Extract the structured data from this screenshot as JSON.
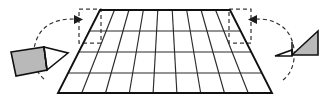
{
  "figure": {
    "canvas": {
      "width": 329,
      "height": 107,
      "background": "#ffffff"
    }
  },
  "colors": {
    "line": "#1b1b1b",
    "grid": "#2a2a2a",
    "dashed": "#3a3a3a",
    "shaded_fill": "#b9b9b9",
    "unshaded_fill": "#ffffff",
    "background": "#ffffff"
  },
  "shape": {
    "name": "trapezoid",
    "vertices": {
      "top_left": [
        100,
        10
      ],
      "top_right": [
        230,
        10
      ],
      "bottom_right": [
        272,
        93
      ],
      "bottom_left": [
        58,
        93
      ]
    },
    "grid": {
      "rows": 4,
      "columns": 9,
      "row_y": [
        10,
        31,
        52,
        73,
        93
      ],
      "note": "Vertical grid lines are slanted, fanning outward from the narrow top edge to the wide bottom edge."
    }
  },
  "dashed_regions": [
    {
      "name": "left-corner-cutout",
      "rect": {
        "x": 79,
        "y": 9,
        "width": 22,
        "height": 34
      },
      "note": "Dashed rectangle marking the left corner triangle removed from the trapezoid."
    },
    {
      "name": "right-corner-cutout",
      "rect": {
        "x": 229,
        "y": 9,
        "width": 22,
        "height": 34
      },
      "note": "Dashed rectangle marking the right corner triangle removed from the trapezoid."
    }
  ],
  "moved_pieces": [
    {
      "name": "left-triangle",
      "orientation": "points right, tilted upward",
      "fill": "shaded with white tip",
      "position": [
        10,
        48
      ]
    },
    {
      "name": "right-triangle",
      "orientation": "points left, tilted upward",
      "fill": "shaded with white tip",
      "position": [
        276,
        30
      ]
    }
  ],
  "motion_arrows": [
    {
      "name": "left-rotation-arrow",
      "direction": "counter-clockwise arc from lower-left triangle up to the left corner cutout",
      "arrow_points": "right"
    },
    {
      "name": "right-rotation-arrow",
      "direction": "clockwise arc from right triangle up to the right corner cutout",
      "arrow_points": "left"
    }
  ]
}
